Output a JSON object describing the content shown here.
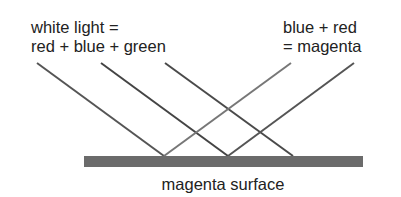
{
  "labels": {
    "white_light_line1": "white light =",
    "white_light_line2": "red + blue + green",
    "reflected_line1": "blue + red",
    "reflected_line2": "= magenta",
    "surface": "magenta surface"
  },
  "rays": {
    "incident": [
      {
        "name": "red-incident-ray",
        "color": "#555555"
      },
      {
        "name": "blue-incident-ray",
        "color": "#444444"
      },
      {
        "name": "green-incident-ray",
        "color": "#4a4a4a"
      }
    ],
    "reflected": [
      {
        "name": "red-reflected-ray",
        "color": "#777777"
      },
      {
        "name": "blue-reflected-ray",
        "color": "#555555"
      }
    ],
    "absorbed": "green"
  },
  "colors": {
    "surface": "#6b6b6b",
    "text": "#222222"
  }
}
